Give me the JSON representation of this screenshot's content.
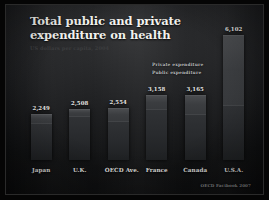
{
  "slide": {
    "title_line_1": "Total public and private",
    "title_line_2": "expenditure on health",
    "subtitle": "US dollars per capita, 2004",
    "source": "OECD Factbook 2007"
  },
  "legend": {
    "private_label": "Private expenditure",
    "public_label": "Public expenditure"
  },
  "colors": {
    "background": "#0d0e0f",
    "title_text": "#f2f2ee",
    "private_segment": "#4a4c4f",
    "public_segment": "#2b2d30",
    "label_text": "#e4e4e1"
  },
  "chart_data": {
    "type": "bar",
    "title": "Total public and private expenditure on health",
    "subtitle": "US dollars per capita, 2004",
    "xlabel": "",
    "ylabel": "",
    "ylim": [
      0,
      6500
    ],
    "grid": false,
    "legend_position": "inside-top-right",
    "stacked": true,
    "categories": [
      "Japan",
      "U.K.",
      "OECD Ave.",
      "France",
      "Canada",
      "U.S.A."
    ],
    "totals": [
      "2,249",
      "2,508",
      "2,554",
      "3,158",
      "3,165",
      "6,102"
    ],
    "total_values": [
      2249,
      2508,
      2554,
      3158,
      3165,
      6102
    ],
    "series": [
      {
        "name": "Public expenditure",
        "values": [
          1800,
          2150,
          1900,
          2500,
          2250,
          2700
        ]
      },
      {
        "name": "Private expenditure",
        "values": [
          449,
          358,
          654,
          658,
          915,
          3402
        ]
      }
    ],
    "source": "OECD Factbook 2007"
  },
  "bars": [
    {
      "category": "Japan",
      "total_label": "2,249",
      "height_pct": 36.9,
      "public_pct": 80.0,
      "private_pct": 20.0
    },
    {
      "category": "U.K.",
      "total_label": "2,508",
      "height_pct": 41.1,
      "public_pct": 85.7,
      "private_pct": 14.3
    },
    {
      "category": "OECD Ave.",
      "total_label": "2,554",
      "height_pct": 41.9,
      "public_pct": 74.4,
      "private_pct": 25.6
    },
    {
      "category": "France",
      "total_label": "3,158",
      "height_pct": 51.8,
      "public_pct": 79.2,
      "private_pct": 20.8
    },
    {
      "category": "Canada",
      "total_label": "3,165",
      "height_pct": 51.9,
      "public_pct": 71.1,
      "private_pct": 28.9
    },
    {
      "category": "U.S.A.",
      "total_label": "6,102",
      "height_pct": 100.0,
      "public_pct": 44.3,
      "private_pct": 55.7
    }
  ]
}
